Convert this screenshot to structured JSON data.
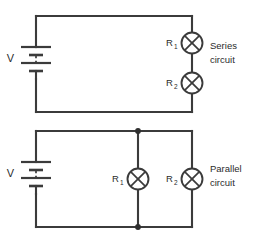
{
  "figure": {
    "background_color": "#ffffff",
    "line_color": "#3b3b3b",
    "text_color": "#2b2b2b",
    "width": 261,
    "height": 249
  },
  "circuits": [
    {
      "id": "series",
      "caption_line1": "Series",
      "caption_line2": "circuit",
      "source": {
        "label": "V",
        "type": "battery-symbol"
      },
      "lamps": [
        {
          "label": "R",
          "subscript": "1",
          "icon": "lamp-icon"
        },
        {
          "label": "R",
          "subscript": "2",
          "icon": "lamp-icon"
        }
      ],
      "junction_dots": 0
    },
    {
      "id": "parallel",
      "caption_line1": "Parallel",
      "caption_line2": "circuit",
      "source": {
        "label": "V",
        "type": "battery-symbol"
      },
      "lamps": [
        {
          "label": "R",
          "subscript": "1",
          "icon": "lamp-icon"
        },
        {
          "label": "R",
          "subscript": "2",
          "icon": "lamp-icon"
        }
      ],
      "junction_dots": 2
    }
  ]
}
